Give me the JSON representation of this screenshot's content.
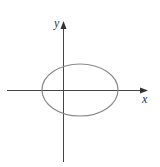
{
  "diagram": {
    "type": "coordinate-plane-ellipse",
    "axes": {
      "x_label": "x",
      "y_label": "y",
      "color": "#444444"
    },
    "ellipse": {
      "stroke": "#888888",
      "description": "ellipse centered slightly right of origin, wider than tall, crossing both axes"
    }
  }
}
